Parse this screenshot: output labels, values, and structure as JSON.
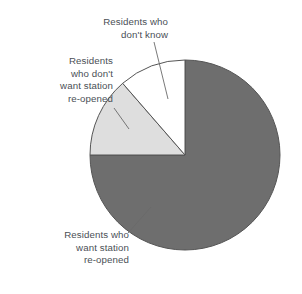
{
  "chart_data": {
    "type": "pie",
    "title": "",
    "subtitle": "",
    "xlabel": "",
    "ylabel": "",
    "legend_position": "none",
    "grid": false,
    "labels_position": "outside-with-leader-lines",
    "start_angle_deg": 0,
    "direction": "clockwise",
    "categories": [
      "Residents who want station re-opened",
      "Residents who don't want station re-opened",
      "Residents who don't know"
    ],
    "values": [
      75,
      13.6,
      11.4
    ],
    "units": "percent",
    "slices": [
      {
        "name": "Residents who want station re-opened",
        "label_lines": [
          "Residents who",
          "want station",
          "re-opened"
        ],
        "value": 75,
        "start_angle_deg": 0,
        "end_angle_deg": 270,
        "color": "#6e6e6e"
      },
      {
        "name": "Residents who don't want station re-opened",
        "label_lines": [
          "Residents",
          "who don't",
          "want station",
          "re-opened"
        ],
        "value": 13.6,
        "start_angle_deg": 270,
        "end_angle_deg": 319,
        "color": "#dedede"
      },
      {
        "name": "Residents who don't know",
        "label_lines": [
          "Residents who",
          "don't know"
        ],
        "value": 11.4,
        "start_angle_deg": 319,
        "end_angle_deg": 360,
        "color": "#ffffff"
      }
    ]
  },
  "labels": {
    "dont_know": "Residents who\ndon't know",
    "dont_want": "Residents\nwho don't\nwant station\nre-opened",
    "want": "Residents who\nwant station\nre-opened"
  },
  "colors": {
    "slice_want": "#6e6e6e",
    "slice_dont_want": "#dedede",
    "slice_dont_know": "#ffffff",
    "outline": "#555555",
    "leader_line": "#6a6a6a",
    "text": "#4a4f55",
    "background": "#ffffff"
  },
  "geometry": {
    "center_x": 185,
    "center_y": 155,
    "radius": 95
  }
}
